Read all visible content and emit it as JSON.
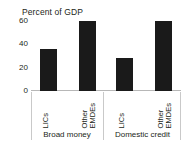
{
  "chart_data": {
    "type": "bar",
    "title": "Percent of GDP",
    "xlabel": "",
    "ylabel": "",
    "ylim": [
      0,
      60
    ],
    "yticks": [
      "60",
      "40",
      "20",
      "0"
    ],
    "ytick_values": [
      60,
      40,
      20,
      0
    ],
    "grid": false,
    "legend": "none",
    "bar_color": "#1a1a1a",
    "groups": [
      {
        "label": "Broad money"
      },
      {
        "label": "Domestic credit"
      }
    ],
    "categories": [
      "LICs",
      "Other EMDEs",
      "LICs",
      "Other EMDEs"
    ],
    "bars": [
      {
        "group": "Broad money",
        "label_line1": "LICs",
        "label_line2": "",
        "value": 36
      },
      {
        "group": "Broad money",
        "label_line1": "Other",
        "label_line2": "EMDEs",
        "value": 60
      },
      {
        "group": "Domestic credit",
        "label_line1": "LICs",
        "label_line2": "",
        "value": 28
      },
      {
        "group": "Domestic credit",
        "label_line1": "Other",
        "label_line2": "EMDEs",
        "value": 60
      }
    ],
    "values": [
      36,
      60,
      28,
      60
    ]
  }
}
